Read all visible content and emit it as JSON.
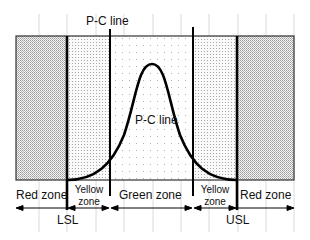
{
  "diagram": {
    "labels": {
      "pc_line_top": "P-C line",
      "pc_line_curve": "P-C line",
      "lsl": "LSL",
      "usl": "USL"
    },
    "zones": [
      {
        "id": "red-left",
        "label": "Red zone",
        "pattern": "dense-dots"
      },
      {
        "id": "yellow-left",
        "label_line1": "Yellow",
        "label_line2": "zone",
        "pattern": "medium-dots"
      },
      {
        "id": "green",
        "label": "Green zone",
        "pattern": "sparse-dots"
      },
      {
        "id": "yellow-right",
        "label_line1": "Yellow",
        "label_line2": "zone",
        "pattern": "medium-dots"
      },
      {
        "id": "red-right",
        "label": "Red zone",
        "pattern": "dense-dots"
      }
    ],
    "colors": {
      "line": "#000000",
      "grid": "#cccccc",
      "dots": "#888888",
      "text": "#111111"
    }
  }
}
